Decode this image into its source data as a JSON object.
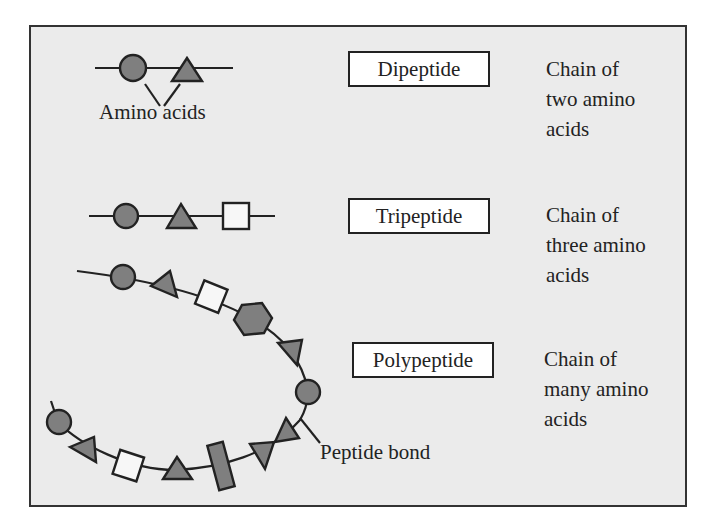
{
  "diagram": {
    "colors": {
      "background": "#ebebeb",
      "frame_border": "#333333",
      "gray_residue": "#7f7f7f",
      "white_residue": "#f7f7f7",
      "text": "#222222"
    },
    "rows": [
      {
        "label": "Dipeptide",
        "description_lines": [
          "Chain of",
          "two amino",
          "acids"
        ],
        "residues": [
          "circle",
          "triangle"
        ],
        "annotation": "Amino acids"
      },
      {
        "label": "Tripeptide",
        "description_lines": [
          "Chain of",
          "three amino",
          "acids"
        ],
        "residues": [
          "circle",
          "triangle",
          "square"
        ]
      },
      {
        "label": "Polypeptide",
        "description_lines": [
          "Chain of",
          "many amino",
          "acids"
        ],
        "residues": [
          "circle",
          "triangle",
          "square",
          "hexagon",
          "triangle",
          "circle",
          "triangle",
          "triangle",
          "rectangle",
          "triangle",
          "square",
          "triangle",
          "circle"
        ],
        "annotation": "Peptide bond"
      }
    ]
  }
}
